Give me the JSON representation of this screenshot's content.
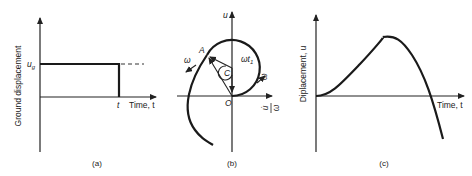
{
  "panel_a": {
    "y_label": "Ground displacement",
    "x_label": "Time, t",
    "level_label": "u",
    "level_sub": "g",
    "step_end_label": "t",
    "caption": "(a)"
  },
  "panel_b": {
    "y_label": "u",
    "x_label_num": "u̇",
    "x_label_den": "ω",
    "origin_label": "O",
    "center_label": "C",
    "point_label": "A",
    "angle_label": "ωt",
    "angle_sub": "1",
    "omega_left": "ω",
    "omega_right": "ω",
    "caption": "(b)"
  },
  "panel_c": {
    "y_label": "Diplacement, u",
    "x_label": "Time, t",
    "caption": "(c)"
  }
}
